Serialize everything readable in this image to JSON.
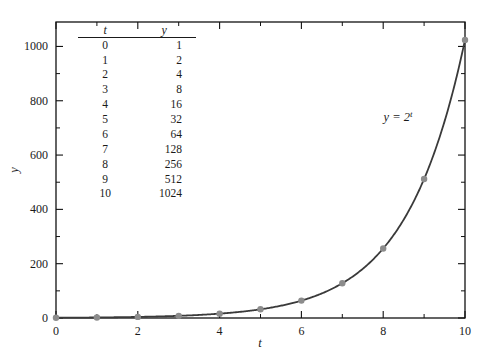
{
  "chart_data": {
    "type": "line",
    "title": "",
    "xlabel": "t",
    "ylabel": "y",
    "xlim": [
      0,
      10
    ],
    "ylim": [
      0,
      1090
    ],
    "grid": false,
    "legend": "none",
    "annotation": {
      "text": "y = 2^t",
      "base": "y = 2",
      "exponent": "t",
      "x": 8.15,
      "y": 700
    },
    "series": [
      {
        "name": "y = 2^t",
        "curve_color": "#3a3a3a",
        "marker_color": "#8c8c8c",
        "x": [
          0,
          1,
          2,
          3,
          4,
          5,
          6,
          7,
          8,
          9,
          10
        ],
        "values": [
          1,
          2,
          4,
          8,
          16,
          32,
          64,
          128,
          256,
          512,
          1024
        ]
      }
    ],
    "x_ticks_major": [
      0,
      2,
      4,
      6,
      8,
      10
    ],
    "x_tick_labels": [
      "0",
      "2",
      "4",
      "6",
      "8",
      "10"
    ],
    "x_ticks_minor": [
      1,
      3,
      5,
      7,
      9
    ],
    "y_ticks_major": [
      0,
      200,
      400,
      600,
      800,
      1000
    ],
    "y_tick_labels": [
      "0",
      "200",
      "400",
      "600",
      "800",
      "1000"
    ],
    "y_ticks_minor": [
      100,
      300,
      500,
      700,
      900
    ]
  },
  "inset_table": {
    "headers": {
      "t": "t",
      "y": "y"
    },
    "rows": [
      {
        "t": "0",
        "y": "1"
      },
      {
        "t": "1",
        "y": "2"
      },
      {
        "t": "2",
        "y": "4"
      },
      {
        "t": "3",
        "y": "8"
      },
      {
        "t": "4",
        "y": "16"
      },
      {
        "t": "5",
        "y": "32"
      },
      {
        "t": "6",
        "y": "64"
      },
      {
        "t": "7",
        "y": "128"
      },
      {
        "t": "8",
        "y": "256"
      },
      {
        "t": "9",
        "y": "512"
      },
      {
        "t": "10",
        "y": "1024"
      }
    ]
  }
}
